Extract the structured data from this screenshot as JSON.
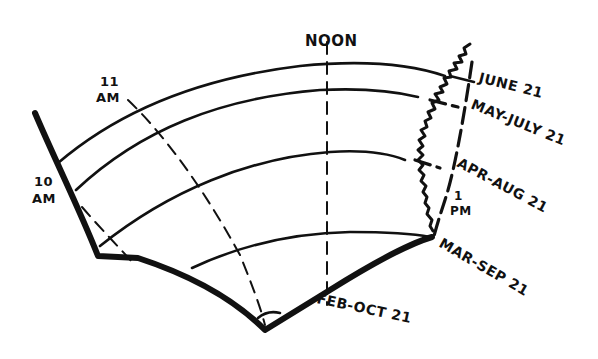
{
  "diagram": {
    "type": "sun-path-sketch",
    "ink_color": "#111111",
    "background": "#ffffff",
    "hour_labels": {
      "ten_am": {
        "line1": "10",
        "line2": "AM"
      },
      "eleven_am": {
        "line1": "11",
        "line2": "AM"
      },
      "noon": "NOON",
      "one_pm": {
        "line1": "1",
        "line2": "PM"
      }
    },
    "date_labels": {
      "june": "JUNE 21",
      "may_july": "MAY-JULY 21",
      "apr_aug": "APR-AUG 21",
      "mar_sep": "MAR-SEP 21",
      "feb_oct": "FEB-OCT 21"
    }
  }
}
